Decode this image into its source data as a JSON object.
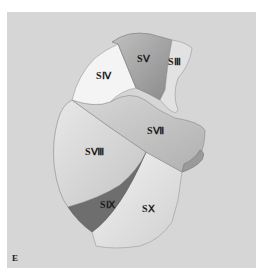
{
  "figure": {
    "panel_letter": "E",
    "background_color": "#d6d6d6",
    "segments": [
      {
        "id": "s4",
        "label": "SⅣ",
        "fill": "#f4f4f4"
      },
      {
        "id": "s5",
        "label": "SⅤ",
        "fill": "#a8a8a8"
      },
      {
        "id": "s3",
        "label": "SⅢ",
        "fill": "#e2e2e2"
      },
      {
        "id": "s7",
        "label": "SⅦ",
        "fill": "#c8c8c8"
      },
      {
        "id": "s8",
        "label": "SⅧ",
        "fill": "#dcdcdc"
      },
      {
        "id": "s9",
        "label": "SⅨ",
        "fill": "#6e6e6e"
      },
      {
        "id": "s10",
        "label": "SⅩ",
        "fill": "#ececec"
      }
    ]
  }
}
